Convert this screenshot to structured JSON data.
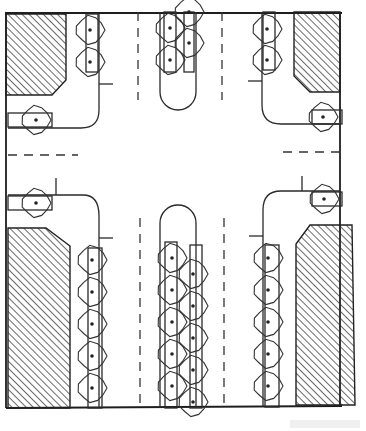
{
  "diagram": {
    "type": "site-plan",
    "colors": {
      "ink": "#222222",
      "paper": "#ffffff"
    },
    "frame": {
      "x": 5,
      "y": 13,
      "w": 337,
      "h": 395
    },
    "hatched_blocks": [
      {
        "name": "hatched-block-top-left",
        "points": "6,14 66,14 66,80 52,95 6,95"
      },
      {
        "name": "hatched-block-top-right",
        "points": "294,12 340,12 340,92 310,92 294,76"
      },
      {
        "name": "hatched-block-bottom-left",
        "points": "8,228 46,228 70,246 70,408 8,408"
      },
      {
        "name": "hatched-block-bottom-right",
        "points": "310,225 352,225 355,405 296,405 296,244"
      }
    ],
    "medians": [
      {
        "name": "median-top",
        "x": 160,
        "y": 12,
        "w": 36,
        "h": 98,
        "rounded": "bottom"
      },
      {
        "name": "median-bottom",
        "x": 160,
        "y": 205,
        "w": 36,
        "h": 203,
        "rounded": "top"
      }
    ],
    "lane_markings": {
      "vertical": [
        {
          "x": 138,
          "y1": 12,
          "y2": 100
        },
        {
          "x": 222,
          "y1": 12,
          "y2": 100
        },
        {
          "x": 140,
          "y1": 218,
          "y2": 408
        },
        {
          "x": 224,
          "y1": 218,
          "y2": 408
        }
      ],
      "horizontal": [
        {
          "y": 155,
          "x1": 8,
          "x2": 78
        },
        {
          "y": 152,
          "x1": 283,
          "x2": 340
        }
      ]
    },
    "tree_rows": [
      {
        "name": "tree-row-top-left",
        "pit": {
          "x": 86,
          "y": 14,
          "w": 12,
          "h": 58
        },
        "trees": [
          [
            90,
            30
          ],
          [
            90,
            62
          ]
        ]
      },
      {
        "name": "tree-row-top-right",
        "pit": {
          "x": 263,
          "y": 12,
          "w": 12,
          "h": 58
        },
        "trees": [
          [
            267,
            29
          ],
          [
            267,
            60
          ]
        ]
      },
      {
        "name": "tree-row-bottom-left",
        "pit": {
          "x": 88,
          "y": 248,
          "w": 14,
          "h": 160
        },
        "trees": [
          [
            92,
            260
          ],
          [
            92,
            292
          ],
          [
            92,
            324
          ],
          [
            92,
            356
          ],
          [
            92,
            388
          ]
        ]
      },
      {
        "name": "tree-row-bottom-right",
        "pit": {
          "x": 265,
          "y": 245,
          "w": 14,
          "h": 162
        },
        "trees": [
          [
            268,
            258
          ],
          [
            268,
            290
          ],
          [
            268,
            322
          ],
          [
            268,
            354
          ],
          [
            268,
            386
          ]
        ]
      },
      {
        "name": "tree-row-median-top-left",
        "pit": {
          "x": 164,
          "y": 12,
          "w": 12,
          "h": 60
        },
        "trees": [
          [
            170,
            28
          ],
          [
            170,
            60
          ]
        ]
      },
      {
        "name": "tree-row-median-top-right",
        "pit": {
          "x": 184,
          "y": 12,
          "w": 10,
          "h": 60
        },
        "trees": [
          [
            189,
            12
          ],
          [
            189,
            43
          ]
        ]
      },
      {
        "name": "tree-row-median-bottom-left",
        "pit": {
          "x": 165,
          "y": 242,
          "w": 12,
          "h": 166
        },
        "trees": [
          [
            172,
            258
          ],
          [
            172,
            290
          ],
          [
            172,
            322
          ],
          [
            172,
            354
          ],
          [
            172,
            386
          ]
        ]
      },
      {
        "name": "tree-row-median-bottom-right",
        "pit": {
          "x": 190,
          "y": 245,
          "w": 12,
          "h": 163
        },
        "trees": [
          [
            193,
            274
          ],
          [
            193,
            306
          ],
          [
            193,
            338
          ],
          [
            193,
            370
          ],
          [
            193,
            402
          ]
        ]
      }
    ],
    "side_trees": [
      {
        "name": "tree-west-north",
        "cx": 36,
        "cy": 120,
        "pit": {
          "x": 8,
          "y": 113,
          "w": 44,
          "h": 14
        }
      },
      {
        "name": "tree-west-south",
        "cx": 36,
        "cy": 203,
        "pit": {
          "x": 8,
          "y": 196,
          "w": 44,
          "h": 14
        }
      },
      {
        "name": "tree-east-north",
        "cx": 323,
        "cy": 117,
        "pit": {
          "x": 312,
          "y": 110,
          "w": 30,
          "h": 14
        }
      },
      {
        "name": "tree-east-south",
        "cx": 324,
        "cy": 199,
        "pit": {
          "x": 312,
          "y": 192,
          "w": 30,
          "h": 14
        }
      }
    ],
    "tree_radius": 15
  }
}
